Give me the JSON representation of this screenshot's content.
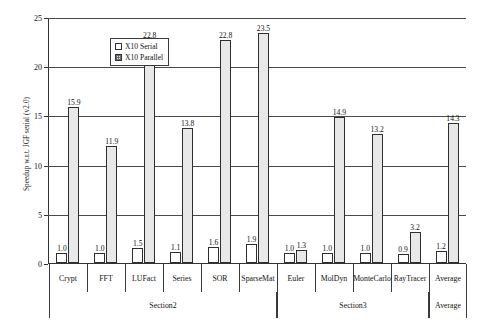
{
  "chart_data": {
    "type": "bar",
    "title": "",
    "xlabel": "",
    "ylabel": "Speedup w.r.t. JGF serial (v2.0)",
    "ylim": [
      0,
      25
    ],
    "yticks": [
      0,
      5,
      10,
      15,
      20,
      25
    ],
    "grid": true,
    "legend_position": "top-left",
    "categories": [
      "Crypt",
      "FFT",
      "LUFact",
      "Series",
      "SOR",
      "SparseMat",
      "Euler",
      "MolDyn",
      "MonteCarlo",
      "RayTracer",
      "Average"
    ],
    "series": [
      {
        "name": "X10 Serial",
        "values": [
          1.0,
          1.0,
          1.5,
          1.1,
          1.6,
          1.9,
          1.0,
          1.0,
          1.0,
          0.9,
          1.2
        ],
        "labels": [
          "1.0",
          "1.0",
          "1.5",
          "1.1",
          "1.6",
          "1.9",
          "1.0",
          "1.0",
          "1.0",
          "0.9",
          "1.2"
        ]
      },
      {
        "name": "X10 Parallel",
        "values": [
          15.9,
          11.9,
          22.8,
          13.8,
          22.8,
          23.5,
          1.3,
          14.9,
          13.2,
          3.2,
          14.3
        ],
        "labels": [
          "15.9",
          "11.9",
          "22.8",
          "13.8",
          "22.8",
          "23.5",
          "1.3",
          "14.9",
          "13.2",
          "3.2",
          "14.3"
        ]
      }
    ],
    "sections": [
      {
        "label": "Section2",
        "start": 0,
        "end": 6
      },
      {
        "label": "Section3",
        "start": 6,
        "end": 10
      },
      {
        "label": "Average",
        "start": 10,
        "end": 11
      }
    ],
    "colors": {
      "serial_fill": "#ffffff",
      "parallel_fill": "#e8e8e8",
      "outline": "#2e2e2e",
      "grid": "#4a4a4a"
    }
  }
}
